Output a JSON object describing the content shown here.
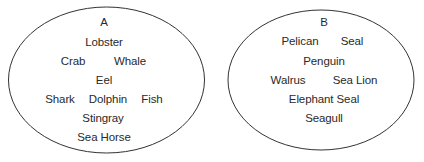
{
  "diagram": {
    "type": "two-set groups",
    "sets": [
      {
        "label": "A",
        "items": [
          "Lobster",
          "Crab",
          "Whale",
          "Eel",
          "Shark",
          "Dolphin",
          "Fish",
          "Stingray",
          "Sea Horse"
        ]
      },
      {
        "label": "B",
        "items": [
          "Pelican",
          "Seal",
          "Penguin",
          "Walrus",
          "Sea Lion",
          "Elephant Seal",
          "Seagull"
        ]
      }
    ]
  }
}
